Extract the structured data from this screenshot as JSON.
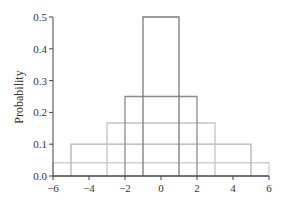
{
  "chart_data": {
    "type": "step",
    "title": "",
    "xlabel": "",
    "ylabel": "Probability",
    "xlim": [
      -6,
      6
    ],
    "ylim": [
      0,
      0.5
    ],
    "xticks": [
      -6,
      -4,
      -2,
      0,
      2,
      4,
      6
    ],
    "xtick_labels": [
      "−6",
      "−4",
      "−2",
      "0",
      "2",
      "4",
      "6"
    ],
    "yticks": [
      0.0,
      0.1,
      0.2,
      0.3,
      0.4,
      0.5
    ],
    "ytick_labels": [
      "0.0",
      "0.1",
      "0.2",
      "0.3",
      "0.4",
      "0.5"
    ],
    "grid": false,
    "legend": null,
    "series": [
      {
        "name": "uniform[-1,1]",
        "x0": -1,
        "x1": 1,
        "height": 0.5,
        "color": "#7a7a7a"
      },
      {
        "name": "uniform[-2,2]",
        "x0": -2,
        "x1": 2,
        "height": 0.25,
        "color": "#8c8c8c"
      },
      {
        "name": "uniform[-3,3]",
        "x0": -3,
        "x1": 3,
        "height": 0.1667,
        "color": "#c4c4c4"
      },
      {
        "name": "uniform[-5,5]",
        "x0": -5,
        "x1": 5,
        "height": 0.1,
        "color": "#b0b0b0"
      },
      {
        "name": "uniform[-6,6]",
        "x0": -6,
        "x1": 6,
        "height": 0.0417,
        "color": "#cfcfcf"
      }
    ]
  }
}
